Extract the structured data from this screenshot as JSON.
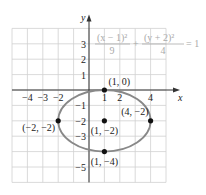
{
  "chart_data": {
    "type": "scatter",
    "title": "",
    "equation": {
      "term1_num": "(x − 1)²",
      "term1_den": "9",
      "plus": "+",
      "term2_num": "(y + 2)²",
      "term2_den": "4",
      "rhs": "= 1"
    },
    "xlabel": "x",
    "ylabel": "y",
    "xlim": [
      -5,
      5
    ],
    "ylim": [
      -6,
      4
    ],
    "grid": true,
    "x_ticks": [
      {
        "value": -4,
        "label": "−4"
      },
      {
        "value": -3,
        "label": "−3"
      },
      {
        "value": -2,
        "label": "−2"
      },
      {
        "value": 1,
        "label": "1"
      },
      {
        "value": 2,
        "label": "2"
      },
      {
        "value": 4,
        "label": "4"
      }
    ],
    "y_ticks": [
      {
        "value": 3,
        "label": "3"
      },
      {
        "value": 2,
        "label": "2"
      },
      {
        "value": 1,
        "label": "1"
      },
      {
        "value": -1,
        "label": "−1"
      },
      {
        "value": -2,
        "label": "−2"
      },
      {
        "value": -3,
        "label": "−3"
      },
      {
        "value": -5,
        "label": "−5"
      }
    ],
    "ellipse": {
      "center": [
        1,
        -2
      ],
      "a": 3,
      "b": 2,
      "color": "#888888"
    },
    "points": [
      {
        "x": 1,
        "y": 0,
        "label": "(1, 0)"
      },
      {
        "x": -2,
        "y": -2,
        "label": "(−2, −2)"
      },
      {
        "x": 1,
        "y": -2,
        "label": "(1, −2)"
      },
      {
        "x": 4,
        "y": -2,
        "label": "(4, −2)"
      },
      {
        "x": 1,
        "y": -4,
        "label": "(1, −4)"
      }
    ]
  },
  "colors": {
    "grid": "#d0d0d0",
    "axis": "#333333",
    "ellipse": "#888888",
    "point": "#111111",
    "equation": "#aaaaaa"
  }
}
